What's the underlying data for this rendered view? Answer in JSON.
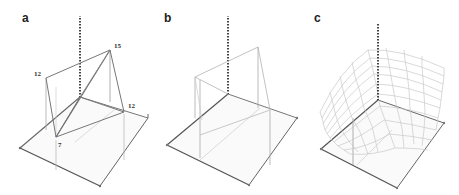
{
  "figure": {
    "panels": [
      {
        "id": "a",
        "label": "a",
        "values": {
          "top_left": "12",
          "top_right": "15",
          "right": "12",
          "front": "7"
        }
      },
      {
        "id": "b",
        "label": "b"
      },
      {
        "id": "c",
        "label": "c"
      }
    ]
  },
  "colors": {
    "plate_edge": "#555555",
    "frame_line": "#888888",
    "light_line": "#c4c4c4",
    "axis": "#444444"
  }
}
